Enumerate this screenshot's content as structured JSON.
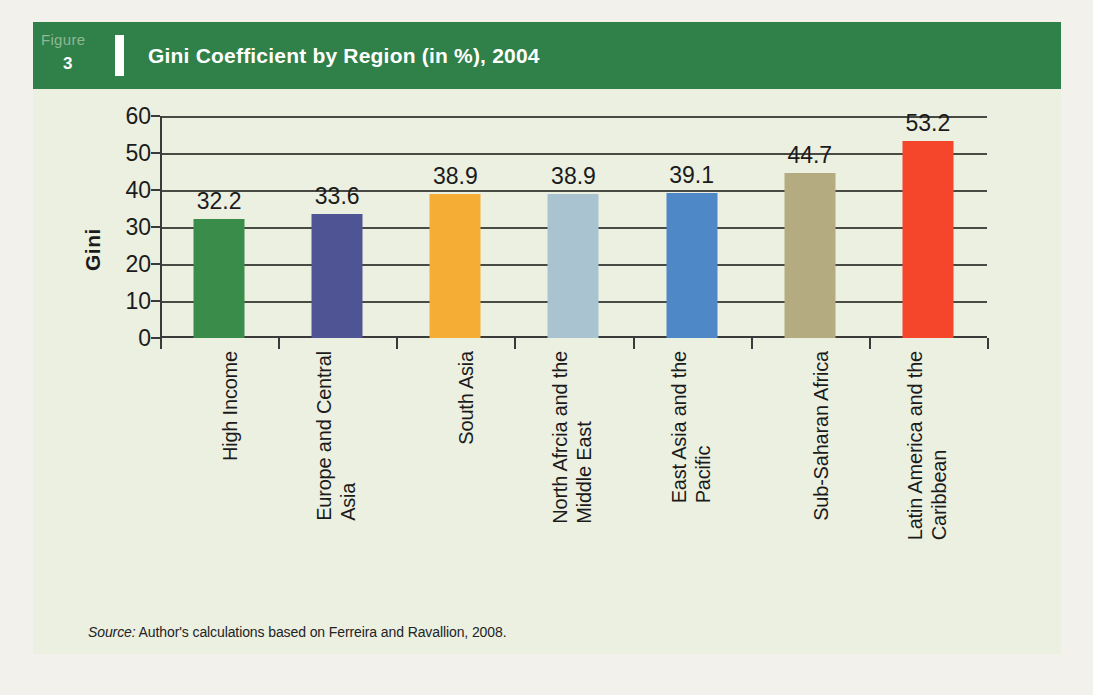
{
  "figure": {
    "label_word": "Figure",
    "number": "3",
    "title": "Gini Coefficient by Region (in %), 2004"
  },
  "source_note": {
    "prefix": "Source:",
    "text": " Author's calculations based on Ferreira and Ravallion, 2008."
  },
  "colors": {
    "banner": "#2f8049",
    "panel": "#ebf0e1",
    "page": "#f2f1ec",
    "axis": "#3a3a3a",
    "gridline": "#4a4a45",
    "text": "#1b1b1b"
  },
  "chart_data": {
    "type": "bar",
    "title": "Gini Coefficient by Region (in %), 2004",
    "xlabel": "",
    "ylabel": "Gini",
    "ylim": [
      0,
      60
    ],
    "ytick_step": 10,
    "yticks": [
      "60",
      "50",
      "40",
      "30",
      "20",
      "10",
      "0"
    ],
    "grid": true,
    "legend": "none",
    "categories": [
      "High Income",
      "Europe and Central Asia",
      "South Asia",
      "North Afrcia and the Middle East",
      "East Asia and the Pacific",
      "Sub-Saharan Africa",
      "Latin America and the Caribbean"
    ],
    "category_lines": [
      [
        "High Income"
      ],
      [
        "Europe and Central",
        "Asia"
      ],
      [
        "South Asia"
      ],
      [
        "North Afrcia and the",
        "Middle East"
      ],
      [
        "East Asia and the",
        "Pacific"
      ],
      [
        "Sub-Saharan Africa"
      ],
      [
        "Latin America and the",
        "Caribbean"
      ]
    ],
    "values": [
      32.2,
      33.6,
      38.9,
      38.9,
      39.1,
      44.7,
      53.2
    ],
    "value_labels": [
      "32.2",
      "33.6",
      "38.9",
      "38.9",
      "39.1",
      "44.7",
      "53.2"
    ],
    "bar_colors": [
      "#3a8c4a",
      "#4e5494",
      "#f5ad36",
      "#a9c3d0",
      "#4e88c7",
      "#b5ab80",
      "#f5452a"
    ]
  }
}
